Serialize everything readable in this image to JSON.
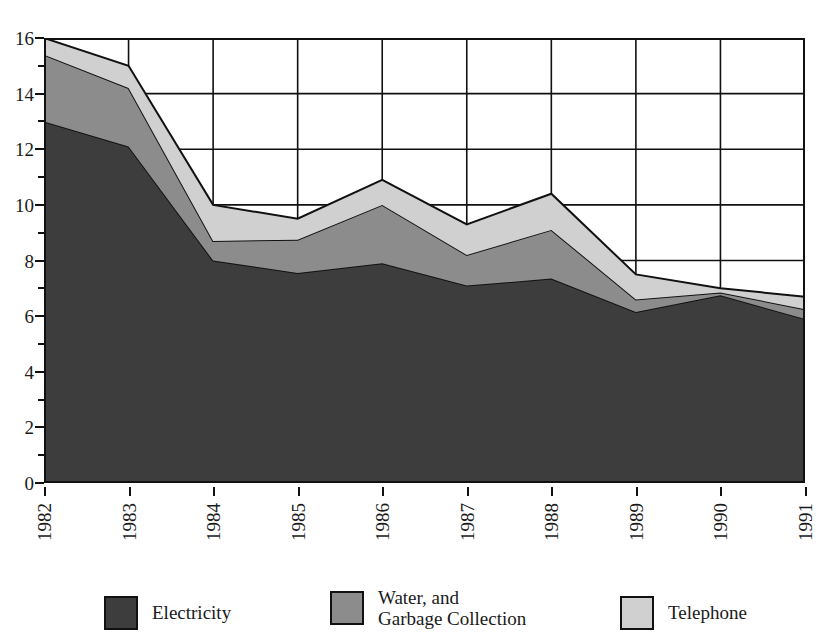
{
  "chart_data": {
    "type": "area",
    "stacked": true,
    "title": "",
    "xlabel": "",
    "ylabel": "",
    "categories": [
      "1982",
      "1983",
      "1984",
      "1985",
      "1986",
      "1987",
      "1988",
      "1989",
      "1990",
      "1991"
    ],
    "series": [
      {
        "name": "Electricity",
        "color": "#3d3d3d",
        "values": [
          13.0,
          12.1,
          8.0,
          7.55,
          7.9,
          7.1,
          7.35,
          6.15,
          6.75,
          5.9
        ]
      },
      {
        "name": "Water, and\nGarbage Collection",
        "color": "#8c8c8c",
        "values": [
          2.4,
          2.1,
          0.7,
          1.2,
          2.1,
          1.1,
          1.75,
          0.45,
          0.1,
          0.35
        ]
      },
      {
        "name": "Telephone",
        "color": "#d0d0d0",
        "values": [
          0.6,
          0.8,
          1.3,
          0.75,
          0.9,
          1.1,
          1.3,
          0.9,
          0.15,
          0.45
        ]
      }
    ],
    "cumulative_tops": [
      {
        "year": "1982",
        "electricity": 13.0,
        "water_garbage_top": 15.4,
        "total": 16.0
      },
      {
        "year": "1983",
        "electricity": 12.1,
        "water_garbage_top": 14.2,
        "total": 15.0
      },
      {
        "year": "1984",
        "electricity": 8.0,
        "water_garbage_top": 8.7,
        "total": 10.0
      },
      {
        "year": "1985",
        "electricity": 7.55,
        "water_garbage_top": 8.75,
        "total": 9.5
      },
      {
        "year": "1986",
        "electricity": 7.9,
        "water_garbage_top": 10.0,
        "total": 10.9
      },
      {
        "year": "1987",
        "electricity": 7.1,
        "water_garbage_top": 8.2,
        "total": 9.3
      },
      {
        "year": "1988",
        "electricity": 7.35,
        "water_garbage_top": 9.1,
        "total": 10.4
      },
      {
        "year": "1989",
        "electricity": 6.15,
        "water_garbage_top": 6.6,
        "total": 7.5
      },
      {
        "year": "1990",
        "electricity": 6.75,
        "water_garbage_top": 6.85,
        "total": 7.0
      },
      {
        "year": "1991",
        "electricity": 5.9,
        "water_garbage_top": 6.25,
        "total": 6.7
      }
    ],
    "ylim": [
      0,
      16
    ],
    "y_major_ticks": [
      0,
      2,
      4,
      6,
      8,
      10,
      12,
      14,
      16
    ],
    "y_minor_ticks": [
      1,
      3,
      5,
      7,
      9,
      11,
      13,
      15
    ],
    "y_tick_labels": [
      "0",
      "2",
      "4",
      "6",
      "8",
      "10",
      "12",
      "14",
      "16"
    ],
    "grid": {
      "horizontal": true,
      "vertical": true,
      "color": "#111111"
    },
    "legend": {
      "position": "bottom",
      "entries": [
        {
          "label": "Electricity",
          "color": "#3d3d3d"
        },
        {
          "label": "Water, and\nGarbage Collection",
          "color": "#8c8c8c"
        },
        {
          "label": "Telephone",
          "color": "#d0d0d0"
        }
      ]
    }
  }
}
